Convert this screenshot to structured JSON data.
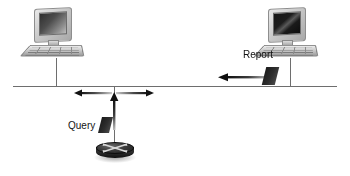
{
  "diagram": {
    "background_color": "#ffffff",
    "line_color": "#6e6e6e",
    "text_color": "#141414",
    "packet_color": "#1b1b1b"
  },
  "labels": {
    "query": "Query",
    "report": "Report"
  },
  "nodes": [
    {
      "id": "left-workstation",
      "name": "left-workstation",
      "type": "computer",
      "screen_style": "gray-gradient"
    },
    {
      "id": "right-workstation",
      "name": "right-workstation",
      "type": "computer",
      "screen_style": "black-gradient"
    },
    {
      "id": "router",
      "name": "router",
      "type": "router"
    }
  ],
  "links": [
    {
      "id": "network-bus",
      "name": "network-bus-line",
      "orientation": "horizontal"
    },
    {
      "id": "left-drop",
      "name": "left-workstation-drop-line",
      "orientation": "vertical"
    },
    {
      "id": "right-drop",
      "name": "right-workstation-drop-line",
      "orientation": "vertical"
    },
    {
      "id": "router-drop",
      "name": "router-drop-line",
      "orientation": "vertical"
    }
  ],
  "flows": [
    {
      "id": "query-flow",
      "label": "Query",
      "direction": "up",
      "from": "router",
      "to": "network-bus",
      "has_packet": true
    },
    {
      "id": "broadcast-flow",
      "label": "",
      "direction": "bidirectional",
      "from": "network-bus",
      "to": "network-bus",
      "has_packet": false
    },
    {
      "id": "report-flow",
      "label": "Report",
      "direction": "left",
      "from": "right-workstation",
      "to": "network-bus",
      "has_packet": true
    }
  ],
  "icons": {
    "router_arrows": "four-way-arrow-icon",
    "monitor": "monitor-icon",
    "keyboard": "keyboard-icon",
    "packet": "data-packet-icon"
  }
}
